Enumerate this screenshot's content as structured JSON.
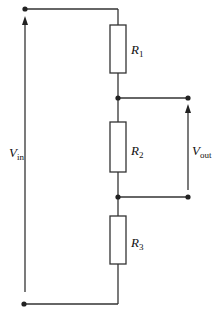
{
  "diagram": {
    "type": "voltage-divider-circuit",
    "resistors": [
      {
        "id": "R1",
        "label": "R",
        "subscript": "1"
      },
      {
        "id": "R2",
        "label": "R",
        "subscript": "2"
      },
      {
        "id": "R3",
        "label": "R",
        "subscript": "3"
      }
    ],
    "input_voltage": {
      "label": "V",
      "subscript": "in"
    },
    "output_voltage": {
      "label": "V",
      "subscript": "out"
    },
    "colors": {
      "line": "#333333",
      "background": "#ffffff"
    }
  }
}
